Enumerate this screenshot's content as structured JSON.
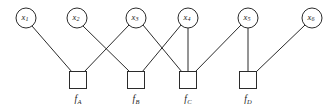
{
  "figure": {
    "type": "factor-graph",
    "width": 328,
    "height": 109,
    "background_color": "#ffffff",
    "stroke_color": "#2b2b2b",
    "text_color": "#1a1a1a"
  },
  "variable_nodes": [
    {
      "id": "x1",
      "base": "x",
      "subscript": "1",
      "label": "x1",
      "cx": 26,
      "cy": 18,
      "r": 10
    },
    {
      "id": "x2",
      "base": "x",
      "subscript": "2",
      "label": "x2",
      "cx": 77,
      "cy": 18,
      "r": 10
    },
    {
      "id": "x3",
      "base": "x",
      "subscript": "3",
      "label": "x3",
      "cx": 136,
      "cy": 18,
      "r": 10
    },
    {
      "id": "x4",
      "base": "x",
      "subscript": "4",
      "label": "x4",
      "cx": 188,
      "cy": 18,
      "r": 10
    },
    {
      "id": "x5",
      "base": "x",
      "subscript": "5",
      "label": "x5",
      "cx": 248,
      "cy": 18,
      "r": 10
    },
    {
      "id": "x6",
      "base": "x",
      "subscript": "6",
      "label": "x6",
      "cx": 312,
      "cy": 18,
      "r": 10
    }
  ],
  "factor_nodes": [
    {
      "id": "fA",
      "base": "f",
      "subscript": "A",
      "label": "fA",
      "cx": 78,
      "cy": 80,
      "size": 17,
      "label_x": 78,
      "label_y": 100
    },
    {
      "id": "fB",
      "base": "f",
      "subscript": "B",
      "label": "fB",
      "cx": 136,
      "cy": 80,
      "size": 17,
      "label_x": 136,
      "label_y": 100
    },
    {
      "id": "fC",
      "base": "f",
      "subscript": "C",
      "label": "fC",
      "cx": 188,
      "cy": 80,
      "size": 17,
      "label_x": 188,
      "label_y": 100
    },
    {
      "id": "fD",
      "base": "f",
      "subscript": "D",
      "label": "fD",
      "cx": 248,
      "cy": 80,
      "size": 17,
      "label_x": 248,
      "label_y": 100
    }
  ],
  "edges": [
    {
      "id": "e-x1-fA",
      "from": "x1",
      "to": "fA",
      "x1": 32,
      "y1": 26,
      "x2": 72,
      "y2": 72
    },
    {
      "id": "e-x3-fA",
      "from": "x3",
      "to": "fA",
      "x1": 129,
      "y1": 25,
      "x2": 84,
      "y2": 72
    },
    {
      "id": "e-x2-fB",
      "from": "x2",
      "to": "fB",
      "x1": 83,
      "y1": 26,
      "x2": 130,
      "y2": 72
    },
    {
      "id": "e-x4-fB",
      "from": "x4",
      "to": "fB",
      "x1": 181,
      "y1": 25,
      "x2": 142,
      "y2": 72
    },
    {
      "id": "e-x3-fC",
      "from": "x3",
      "to": "fC",
      "x1": 143,
      "y1": 25,
      "x2": 182,
      "y2": 72
    },
    {
      "id": "e-x4-fC",
      "from": "x4",
      "to": "fC",
      "x1": 188,
      "y1": 28,
      "x2": 188,
      "y2": 72
    },
    {
      "id": "e-x5-fC",
      "from": "x5",
      "to": "fC",
      "x1": 241,
      "y1": 25,
      "x2": 195,
      "y2": 72
    },
    {
      "id": "e-x5-fD",
      "from": "x5",
      "to": "fD",
      "x1": 248,
      "y1": 28,
      "x2": 248,
      "y2": 72
    },
    {
      "id": "e-x6-fD",
      "from": "x6",
      "to": "fD",
      "x1": 305,
      "y1": 25,
      "x2": 256,
      "y2": 72
    }
  ],
  "adjacency": {
    "fA": [
      "x1",
      "x3"
    ],
    "fB": [
      "x2",
      "x4"
    ],
    "fC": [
      "x3",
      "x4",
      "x5"
    ],
    "fD": [
      "x5",
      "x6"
    ]
  }
}
